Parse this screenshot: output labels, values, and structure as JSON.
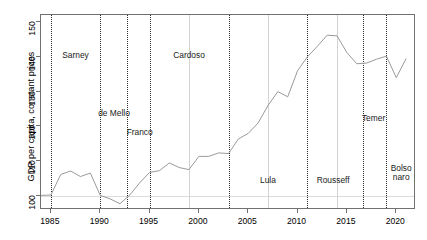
{
  "chart_data": {
    "type": "line",
    "title": "",
    "xlabel": "",
    "ylabel": "GDP per capita, constant prices",
    "xlim": [
      1984,
      2022
    ],
    "ylim": [
      96,
      152
    ],
    "xticks": [
      1985,
      1990,
      1995,
      2000,
      2005,
      2010,
      2015,
      2020
    ],
    "yticks": [
      100,
      110,
      120,
      130,
      140,
      150
    ],
    "grid": false,
    "legend_position": "none",
    "reference_line_y": 100,
    "series": [
      {
        "name": "GDP per capita, constant prices",
        "color": "#9a9a9a",
        "x": [
          1984,
          1985,
          1986,
          1987,
          1988,
          1989,
          1990,
          1991,
          1992,
          1993,
          1994,
          1995,
          1996,
          1997,
          1998,
          1999,
          2000,
          2001,
          2002,
          2003,
          2004,
          2005,
          2006,
          2007,
          2008,
          2009,
          2010,
          2011,
          2012,
          2013,
          2014,
          2015,
          2016,
          2017,
          2018,
          2019,
          2020,
          2021
        ],
        "values": [
          100.2,
          100.3,
          106.2,
          107.2,
          105.6,
          106.6,
          100.2,
          99.2,
          97.8,
          100.3,
          103.8,
          106.8,
          107.3,
          109.5,
          108.2,
          107.6,
          111.4,
          111.4,
          112.4,
          112.2,
          116.4,
          118.0,
          121.0,
          126.0,
          130.0,
          128.5,
          136.0,
          140.0,
          143.0,
          146.2,
          146.0,
          141.2,
          138.0,
          138.2,
          139.3,
          140.2,
          134.0,
          139.5
        ]
      }
    ],
    "regime_change_years": [
      1985,
      1990,
      1992.7,
      1995,
      2003,
      2011,
      2016.6,
      2019
    ],
    "term_marker_years": [
      1999,
      2007,
      2014
    ],
    "annotations": [
      {
        "label": "Sarney",
        "x": 1987.5,
        "y": 140.2
      },
      {
        "label": "de Mello",
        "x": 1991.4,
        "y": 123.5
      },
      {
        "label": "Franco",
        "x": 1994.0,
        "y": 118.0
      },
      {
        "label": "Cardoso",
        "x": 1999.0,
        "y": 140.2
      },
      {
        "label": "Lula",
        "x": 2007.0,
        "y": 104.4
      },
      {
        "label": "Rousseff",
        "x": 2013.6,
        "y": 104.4
      },
      {
        "label": "Temer",
        "x": 2017.7,
        "y": 122.0
      },
      {
        "label": "Bolso\nnaro",
        "x": 2020.5,
        "y": 107.8
      }
    ]
  }
}
